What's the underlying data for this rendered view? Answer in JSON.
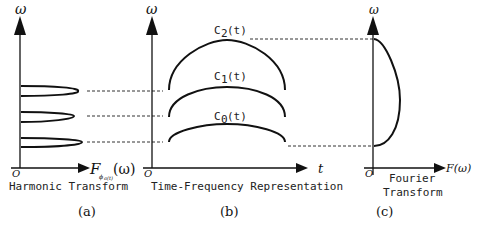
{
  "panels": {
    "a": {
      "y_axis_label": "ω",
      "x_axis_label": "F",
      "x_axis_subscript": "ϕ",
      "x_axis_subsubscript": "a(t)",
      "x_axis_arg": "(ω)",
      "origin_label": "O",
      "caption": "Harmonic Transform",
      "tag": "(a)"
    },
    "b": {
      "y_axis_label": "ω",
      "x_axis_label": "t",
      "origin_label": "O",
      "caption": "Time-Frequency Representation",
      "tag": "(b)",
      "curves": [
        {
          "label": "C",
          "sub": "2",
          "arg": "(t)"
        },
        {
          "label": "C",
          "sub": "1",
          "arg": "(t)"
        },
        {
          "label": "C",
          "sub": "0",
          "arg": "(t)"
        }
      ]
    },
    "c": {
      "y_axis_label": "ω",
      "x_axis_label": "F(ω)",
      "origin_label": "O",
      "caption_line1": "Fourier",
      "caption_line2": "Transform",
      "tag": "(c)"
    }
  },
  "colors": {
    "stroke": "#111111",
    "background": "#ffffff"
  }
}
